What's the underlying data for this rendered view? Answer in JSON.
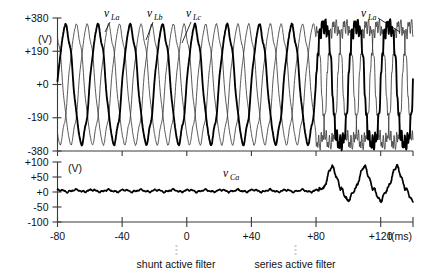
{
  "figure": {
    "title": "",
    "background": "#ffffff"
  },
  "panels": {
    "top": {
      "unit": "(V)",
      "y_ticks": [
        "+380",
        "+190",
        "+0",
        "-190",
        "-380"
      ],
      "y_values": [
        380,
        190,
        0,
        -190,
        -380
      ],
      "signal_labels": [
        {
          "base": "v",
          "sub": "La"
        },
        {
          "base": "v",
          "sub": "Lb"
        },
        {
          "base": "v",
          "sub": "Lc"
        },
        {
          "base": "v",
          "sub": "La"
        }
      ]
    },
    "bottom": {
      "unit": "(V)",
      "y_ticks": [
        "+100",
        "+50",
        "+0",
        "-50",
        "-100"
      ],
      "y_values": [
        100,
        50,
        0,
        -50,
        -100
      ],
      "signal_labels": [
        {
          "base": "v",
          "sub": "Ca"
        }
      ]
    }
  },
  "x_axis": {
    "label": "t(ms)",
    "ticks": [
      "-80",
      "-40",
      "0",
      "+40",
      "+80",
      "+120"
    ],
    "values": [
      -80,
      -40,
      0,
      40,
      80,
      120
    ],
    "range": [
      -80,
      140
    ]
  },
  "annotations": {
    "shunt": "shunt active filter",
    "series": "series active filter"
  },
  "chart_data": {
    "type": "line",
    "title": "",
    "xlabel": "t(ms)",
    "ylabel": "",
    "panels": [
      {
        "name": "line voltages",
        "ylabel": "(V)",
        "ylim": [
          -380,
          380
        ],
        "xlim": [
          -80,
          140
        ],
        "yticks": [
          -380,
          -190,
          0,
          190,
          380
        ],
        "grid": false,
        "series": [
          {
            "name": "v_La",
            "emphasis": "bold",
            "amplitude": 330,
            "frequency_hz": 50,
            "phase_deg": 0,
            "waveform": "sine, flat-topped/distorted after t=+80 ms"
          },
          {
            "name": "v_Lb",
            "emphasis": "thin",
            "amplitude": 330,
            "frequency_hz": 50,
            "phase_deg": -120,
            "waveform": "sine, flat-topped/distorted after t=+80 ms"
          },
          {
            "name": "v_Lc",
            "emphasis": "thin",
            "amplitude": 330,
            "frequency_hz": 50,
            "phase_deg": 120,
            "waveform": "sine, flat-topped/distorted after t=+80 ms"
          }
        ]
      },
      {
        "name": "compensation voltage",
        "ylabel": "(V)",
        "ylim": [
          -100,
          100
        ],
        "xlim": [
          -80,
          140
        ],
        "yticks": [
          -100,
          -50,
          0,
          50,
          100
        ],
        "grid": false,
        "series": [
          {
            "name": "v_Ca",
            "emphasis": "bold",
            "segments": [
              {
                "from": -80,
                "to": 82,
                "description": "near zero with small ripple, amplitude approx 5 V"
              },
              {
                "from": 82,
                "to": 140,
                "description": "large oscillation, +65 V peak to -35 V trough, approx 50 Hz"
              }
            ]
          }
        ]
      }
    ],
    "events": [
      {
        "t": 0,
        "label": "shunt active filter"
      },
      {
        "t": 80,
        "label": "series active filter"
      }
    ]
  }
}
